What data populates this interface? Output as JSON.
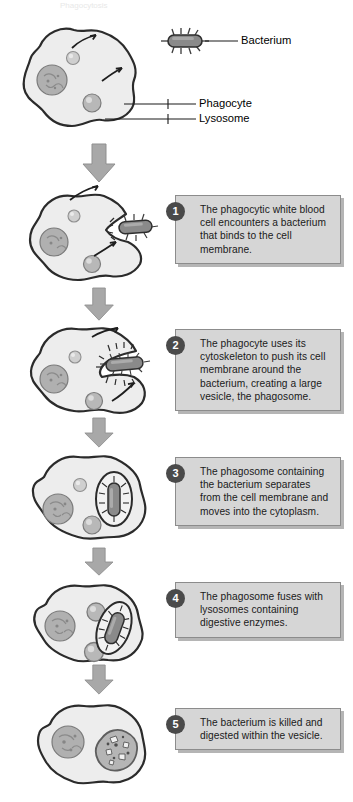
{
  "diagram": {
    "title": "Phagocytosis",
    "legend": {
      "bacterium_label": "Bacterium",
      "phagocyte_label": "Phagocyte",
      "lysosome_label": "Lysosome"
    },
    "steps": [
      {
        "number": "1",
        "text": "The phagocytic white blood cell encounters a bacterium that binds to the cell membrane."
      },
      {
        "number": "2",
        "text": "The phagocyte uses its cytoskeleton to push its cell membrane around the bacterium, creating a large vesicle, the phagosome."
      },
      {
        "number": "3",
        "text": "The phagosome containing the bacterium separates from the cell membrane and moves into the cytoplasm."
      },
      {
        "number": "4",
        "text": "The phagosome fuses with lysosomes containing digestive enzymes."
      },
      {
        "number": "5",
        "text": "The bacterium is killed and digested within the vesicle."
      }
    ],
    "colors": {
      "cell_fill": "#ededed",
      "cell_outline": "#2b2b2b",
      "organelle_fill": "#b5b5b5",
      "nucleus_fill": "#a8a8a8",
      "bacterium_fill": "#7d7d7d",
      "arrow_gray": "#a6a6a6",
      "box_fill": "#d6d6d6",
      "box_border": "#8c8c8c",
      "badge_fill": "#4a4a4a"
    }
  }
}
